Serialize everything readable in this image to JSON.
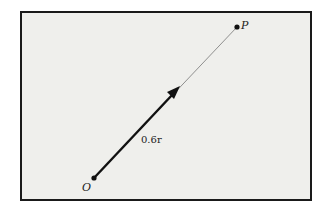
{
  "diagram": {
    "type": "vector",
    "points": {
      "origin": {
        "label": "O",
        "x": 94,
        "y": 178
      },
      "target": {
        "label": "P",
        "x": 237,
        "y": 27
      }
    },
    "vector": {
      "label": "0.6r",
      "from": "O",
      "fraction_of_OP": 0.6
    },
    "colors": {
      "frame_background": "#efefec",
      "frame_border": "#1a1a1a",
      "vector": "#111111",
      "guide_line": "#666666",
      "page_background": "#ffffff"
    }
  }
}
